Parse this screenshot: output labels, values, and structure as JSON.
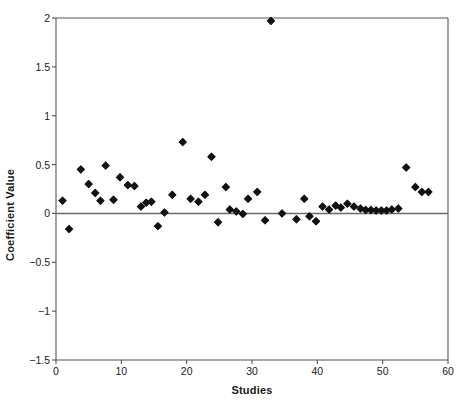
{
  "chart_data": {
    "type": "scatter",
    "title": "",
    "xlabel": "Studies",
    "ylabel": "Coefficient Value",
    "xlim": [
      0,
      60
    ],
    "ylim": [
      -1.5,
      2
    ],
    "xticks": [
      "0",
      "10",
      "20",
      "30",
      "40",
      "50",
      "60"
    ],
    "xtick_values": [
      0,
      10,
      20,
      30,
      40,
      50,
      60
    ],
    "yticks": [
      "2",
      "1.5",
      "1",
      "0.5",
      "0",
      "−0.5",
      "−1",
      "−1.5"
    ],
    "ytick_values": [
      2,
      1.5,
      1,
      0.5,
      0,
      -0.5,
      -1,
      -1.5
    ],
    "grid": false,
    "legend": null,
    "zero_reference_line": 0,
    "marker": "diamond",
    "marker_color": "#111111",
    "axis_color": "#555555",
    "series": [
      {
        "name": "Coefficient Value",
        "x": [
          1,
          2,
          3.8,
          5,
          6,
          6.8,
          7.6,
          8.8,
          9.8,
          11,
          12,
          13,
          13.8,
          14.6,
          15.6,
          16.6,
          17.8,
          19.4,
          20.6,
          21.8,
          22.8,
          23.8,
          24.8,
          26,
          26.6,
          27.6,
          28.6,
          29.4,
          30.8,
          32,
          34.6,
          36.8,
          38,
          38.8,
          39.8,
          40.8,
          41.8,
          42.8,
          43.6,
          44.6,
          45.6,
          46.6,
          47.4,
          48.2,
          49,
          49.8,
          50.6,
          51.4,
          52.4,
          53.6,
          55,
          56,
          57
        ],
        "y": [
          0.13,
          -0.16,
          0.45,
          0.3,
          0.21,
          0.13,
          0.49,
          0.14,
          0.37,
          0.29,
          0.28,
          0.07,
          0.11,
          0.12,
          -0.13,
          0.01,
          0.19,
          0.73,
          0.15,
          0.12,
          0.19,
          0.58,
          -0.09,
          0.27,
          0.04,
          0.02,
          -0.005,
          0.15,
          0.22,
          -0.07,
          0.0,
          -0.06,
          0.15,
          -0.03,
          -0.08,
          0.07,
          0.04,
          0.08,
          0.06,
          0.1,
          0.07,
          0.05,
          0.035,
          0.035,
          0.03,
          0.03,
          0.03,
          0.04,
          0.05,
          0.47,
          0.27,
          0.22,
          0.22
        ]
      },
      {
        "name": "outlier",
        "x": [
          32.9
        ],
        "y": [
          1.97
        ]
      }
    ]
  },
  "axes": {
    "x_pixel_origin": 56,
    "x_pixel_end": 448,
    "y_pixel_top": 18,
    "y_pixel_bottom": 360
  }
}
